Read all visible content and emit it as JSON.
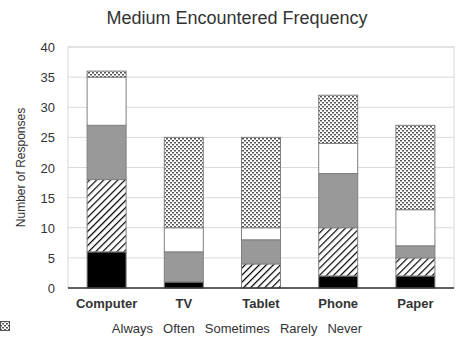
{
  "chart_data": {
    "type": "bar",
    "stacked": true,
    "title": "Medium Encountered Frequency",
    "xlabel": "",
    "ylabel": "Number of Responses",
    "ylim": [
      0,
      40
    ],
    "yticks": [
      0,
      5,
      10,
      15,
      20,
      25,
      30,
      35,
      40
    ],
    "grid": true,
    "legend_position": "bottom",
    "categories": [
      "Computer",
      "TV",
      "Tablet",
      "Phone",
      "Paper"
    ],
    "series": [
      {
        "name": "Always",
        "values": [
          6,
          1,
          0,
          2,
          2
        ],
        "fill": "solid-black"
      },
      {
        "name": "Often",
        "values": [
          12,
          0,
          4,
          8,
          3
        ],
        "fill": "diagonal-hatch"
      },
      {
        "name": "Sometimes",
        "values": [
          9,
          5,
          4,
          9,
          2
        ],
        "fill": "solid-gray"
      },
      {
        "name": "Rarely",
        "values": [
          8,
          4,
          2,
          5,
          6
        ],
        "fill": "white"
      },
      {
        "name": "Never",
        "values": [
          1,
          15,
          15,
          8,
          14
        ],
        "fill": "dotted"
      }
    ]
  },
  "colors": {
    "always": "#000000",
    "sometimes": "#999999",
    "rarely": "#ffffff",
    "grid": "#d9d9d9",
    "axis": "#333333"
  }
}
